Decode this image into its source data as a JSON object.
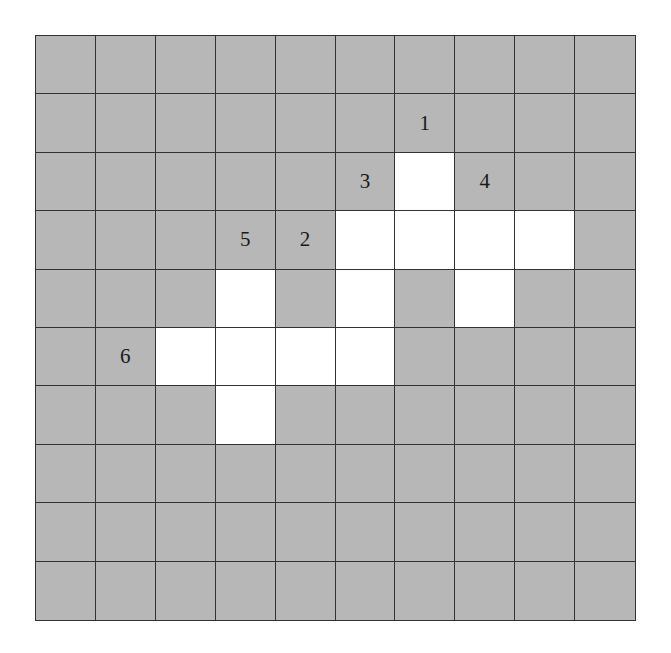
{
  "puzzle": {
    "rows": 10,
    "cols": 10,
    "colors": {
      "blocked": "#b7b7b7",
      "open": "#ffffff",
      "line": "#333333"
    },
    "open_cells": [
      [
        2,
        6
      ],
      [
        3,
        5
      ],
      [
        3,
        6
      ],
      [
        3,
        7
      ],
      [
        3,
        8
      ],
      [
        4,
        3
      ],
      [
        4,
        5
      ],
      [
        4,
        7
      ],
      [
        5,
        2
      ],
      [
        5,
        3
      ],
      [
        5,
        4
      ],
      [
        5,
        5
      ],
      [
        6,
        3
      ]
    ],
    "labels": [
      {
        "row": 1,
        "col": 6,
        "text": "1"
      },
      {
        "row": 3,
        "col": 4,
        "text": "2"
      },
      {
        "row": 2,
        "col": 5,
        "text": "3"
      },
      {
        "row": 2,
        "col": 7,
        "text": "4"
      },
      {
        "row": 3,
        "col": 3,
        "text": "5"
      },
      {
        "row": 5,
        "col": 1,
        "text": "6"
      }
    ]
  }
}
